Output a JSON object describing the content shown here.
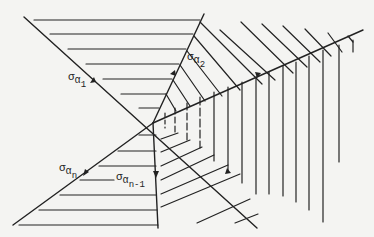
{
  "diagram": {
    "type": "fan-of-rays",
    "center": [
      153,
      123
    ],
    "stroke_color": "#222222",
    "background": "#f4f4f2",
    "rays": [
      {
        "name": "sigma-alpha-1",
        "end": [
          24,
          17
        ],
        "opposite_end": [
          257,
          228
        ]
      },
      {
        "name": "sigma-alpha-2",
        "end": [
          204,
          14
        ]
      },
      {
        "name": "right-ray",
        "end": [
          363,
          30
        ]
      },
      {
        "name": "sigma-alpha-n",
        "end": [
          13,
          225
        ]
      },
      {
        "name": "sigma-alpha-n-1",
        "end": [
          158,
          228
        ]
      }
    ],
    "labels": [
      {
        "id": "a1",
        "sym": "σ",
        "sub": "α",
        "subsub": "1",
        "x": 68,
        "y": 72
      },
      {
        "id": "a2",
        "sym": "σ",
        "sub": "α",
        "subsub": "2",
        "x": 187,
        "y": 52
      },
      {
        "id": "an",
        "sym": "σ",
        "sub": "α",
        "subsub": "n",
        "x": 59,
        "y": 163
      },
      {
        "id": "an1",
        "sym": "σ",
        "sub": "α",
        "subsub": "n-1",
        "x": 116,
        "y": 172
      }
    ]
  }
}
